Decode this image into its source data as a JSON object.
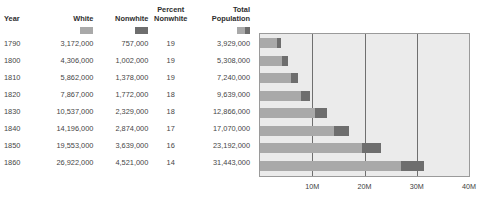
{
  "table": {
    "columns": [
      {
        "key": "year",
        "label": "Year",
        "swatch": null
      },
      {
        "key": "white",
        "label": "White",
        "swatch": "white-swatch"
      },
      {
        "key": "nonwhite",
        "label": "Nonwhite",
        "swatch": "nonwhite-swatch"
      },
      {
        "key": "pct",
        "label": "Percent\nNonwhite",
        "swatch": null
      },
      {
        "key": "total",
        "label": "Total\nPopulation",
        "swatch": "total-swatch"
      }
    ],
    "rows": [
      {
        "year": "1790",
        "white": "3,172,000",
        "nonwhite": "757,000",
        "pct": "19",
        "total": "3,929,000"
      },
      {
        "year": "1800",
        "white": "4,306,000",
        "nonwhite": "1,002,000",
        "pct": "19",
        "total": "5,308,000"
      },
      {
        "year": "1810",
        "white": "5,862,000",
        "nonwhite": "1,378,000",
        "pct": "19",
        "total": "7,240,000"
      },
      {
        "year": "1820",
        "white": "7,867,000",
        "nonwhite": "1,772,000",
        "pct": "18",
        "total": "9,639,000"
      },
      {
        "year": "1830",
        "white": "10,537,000",
        "nonwhite": "2,329,000",
        "pct": "18",
        "total": "12,866,000"
      },
      {
        "year": "1840",
        "white": "14,196,000",
        "nonwhite": "2,874,000",
        "pct": "17",
        "total": "17,070,000"
      },
      {
        "year": "1850",
        "white": "19,553,000",
        "nonwhite": "3,639,000",
        "pct": "16",
        "total": "23,192,000"
      },
      {
        "year": "1860",
        "white": "26,922,000",
        "nonwhite": "4,521,000",
        "pct": "14",
        "total": "31,443,000"
      }
    ]
  },
  "colors": {
    "white_series": "#a9a9a9",
    "nonwhite_series": "#6e6e6e",
    "plot_background": "#ebebeb",
    "gridline": "#6f6f6f",
    "plot_border": "#9a9a9a"
  },
  "chart_data": {
    "type": "bar",
    "orientation": "horizontal",
    "stacked": true,
    "title": "",
    "xlabel": "",
    "ylabel": "",
    "xlim": [
      0,
      40000000
    ],
    "grid": true,
    "legend_position": "table-header-swatches",
    "tick_values": [
      10000000,
      20000000,
      30000000,
      40000000
    ],
    "tick_labels": [
      "10M",
      "20M",
      "30M",
      "40M"
    ],
    "categories": [
      "1790",
      "1800",
      "1810",
      "1820",
      "1830",
      "1840",
      "1850",
      "1860"
    ],
    "series": [
      {
        "name": "White",
        "color": "#a9a9a9",
        "values": [
          3172000,
          4306000,
          5862000,
          7867000,
          10537000,
          14196000,
          19553000,
          26922000
        ]
      },
      {
        "name": "Nonwhite",
        "color": "#6e6e6e",
        "values": [
          757000,
          1002000,
          1378000,
          1772000,
          2329000,
          2874000,
          3639000,
          4521000
        ]
      }
    ],
    "totals": [
      3929000,
      5308000,
      7240000,
      9639000,
      12866000,
      17070000,
      23192000,
      31443000
    ],
    "percent_nonwhite": [
      19,
      19,
      19,
      18,
      18,
      17,
      16,
      14
    ]
  }
}
